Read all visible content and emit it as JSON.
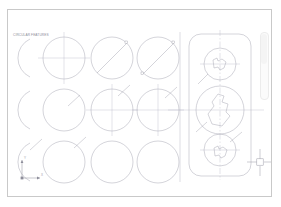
{
  "app": {
    "type": "cad-drawing-editor",
    "canvas_background": "#ffffff",
    "frame_border_color": "#c9c9c9",
    "line_color": "#a9a9b4",
    "centerline_color": "#b9b9c4",
    "dim_text_color": "#9a9aa6"
  },
  "drawing": {
    "title_block_text": "CIRCULAR FEATURES",
    "title_block_legible": false,
    "grid": {
      "columns": 4,
      "rows": 3,
      "description": "grid of circular features"
    }
  },
  "circles": [
    {
      "name": "arc-r1c1",
      "cx": 9,
      "cy": 48,
      "r": 21,
      "style": "arc-clipped",
      "crosshair": false,
      "diameter_line": false
    },
    {
      "name": "circle-r1c2",
      "cx": 56,
      "cy": 48,
      "r": 21,
      "style": "circle",
      "crosshair": true,
      "diameter_line": false
    },
    {
      "name": "circle-r1c3",
      "cx": 104,
      "cy": 48,
      "r": 21,
      "style": "circle",
      "crosshair": false,
      "diameter_line": true,
      "diameter_angle": -45
    },
    {
      "name": "circle-r1c4",
      "cx": 150,
      "cy": 48,
      "r": 21,
      "style": "circle",
      "crosshair": false,
      "diameter_line": true,
      "diameter_angle": -40
    },
    {
      "name": "arc-r2c1",
      "cx": 9,
      "cy": 100,
      "r": 21,
      "style": "arc-clipped",
      "crosshair": false,
      "diameter_line": false
    },
    {
      "name": "circle-r2c2",
      "cx": 56,
      "cy": 100,
      "r": 21,
      "style": "circle",
      "crosshair": false,
      "diameter_line": false
    },
    {
      "name": "circle-r2c3",
      "cx": 104,
      "cy": 100,
      "r": 21,
      "style": "circle",
      "crosshair": true,
      "diameter_line": false
    },
    {
      "name": "circle-r2c4",
      "cx": 150,
      "cy": 100,
      "r": 21,
      "style": "circle",
      "crosshair": true,
      "diameter_line": false
    },
    {
      "name": "arc-r3c1",
      "cx": 9,
      "cy": 152,
      "r": 21,
      "style": "arc-clipped",
      "crosshair": false,
      "diameter_line": false
    },
    {
      "name": "circle-r3c2",
      "cx": 56,
      "cy": 152,
      "r": 21,
      "style": "circle",
      "crosshair": false,
      "diameter_line": false
    },
    {
      "name": "circle-r3c3",
      "cx": 104,
      "cy": 152,
      "r": 21,
      "style": "circle",
      "crosshair": false,
      "diameter_line": false
    },
    {
      "name": "circle-r3c4",
      "cx": 150,
      "cy": 152,
      "r": 21,
      "style": "circle",
      "crosshair": false,
      "diameter_line": false
    }
  ],
  "dimension_callouts": [
    {
      "name": "dim-r2c2",
      "x": 62,
      "y": 92,
      "angle": -42,
      "text": "R20",
      "legible": false
    },
    {
      "name": "dim-r2c3",
      "x": 112,
      "y": 82,
      "angle": -42,
      "text": "R20",
      "legible": false
    },
    {
      "name": "dim-r2c4",
      "x": 158,
      "y": 84,
      "angle": -42,
      "text": "R20",
      "legible": false
    },
    {
      "name": "dim-r3c1",
      "x": 20,
      "y": 130,
      "angle": -42,
      "text": "R20",
      "legible": false
    },
    {
      "name": "dim-r3c2",
      "x": 64,
      "y": 130,
      "angle": -42,
      "text": "R20",
      "legible": false
    },
    {
      "name": "dim-panel-top",
      "x": 28,
      "y": 42,
      "angle": -52,
      "text": "R10",
      "legible": false
    },
    {
      "name": "dim-panel-middle",
      "x": 24,
      "y": 104,
      "angle": -52,
      "text": "R14",
      "legible": false
    },
    {
      "name": "dim-panel-bottom",
      "x": 60,
      "y": 118,
      "angle": -52,
      "text": "R10",
      "legible": false
    }
  ],
  "detail_panel": {
    "name": "assembly-plate",
    "shape": "rounded-rectangle",
    "x": 9,
    "y": 14,
    "width": 62,
    "height": 152,
    "corner_radius": 12,
    "features": [
      {
        "name": "bore-top",
        "cx": 40,
        "cy": 42,
        "r": 16,
        "inner_shape": "key-profile",
        "crosshair": true
      },
      {
        "name": "bore-middle",
        "cx": 40,
        "cy": 90,
        "r": 24,
        "inner_shape": "key-profile",
        "crosshair": true
      },
      {
        "name": "bore-bottom",
        "cx": 40,
        "cy": 140,
        "r": 16,
        "inner_shape": "key-profile",
        "crosshair": true
      }
    ],
    "divider_line": {
      "name": "section-divider",
      "x": 1
    }
  },
  "ucs_icon": {
    "name": "ucs-axis-icon",
    "x": 12,
    "y": 168,
    "x_label": "X",
    "y_label": "Y"
  },
  "cursor": {
    "name": "crosshair-cursor",
    "x": 252,
    "y": 152,
    "pickbox_size": 7,
    "arm_length": 13
  }
}
